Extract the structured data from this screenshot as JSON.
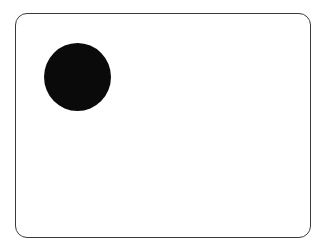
{
  "canvas": {
    "background": "#ffffff"
  },
  "frame": {
    "shape": "rounded-rectangle",
    "border_color": "#3a3a3a",
    "fill": "#ffffff"
  },
  "dot": {
    "shape": "circle",
    "fill": "#0a0a0a"
  }
}
